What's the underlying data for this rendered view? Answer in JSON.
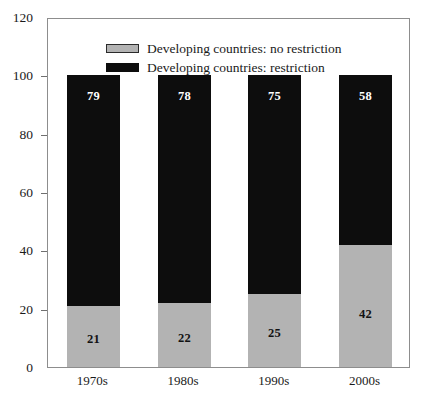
{
  "caption_sliver": " ",
  "legend": {
    "position": "top-left-inside",
    "items": [
      {
        "label": "Developing countries: no restriction",
        "swatch": "gray-swatch",
        "color": "#b3b3b3"
      },
      {
        "label": "Developing countries: restriction",
        "swatch": "black-swatch",
        "color": "#0d0d0d"
      }
    ]
  },
  "axes": {
    "y_ticks": [
      "0",
      "20",
      "40",
      "60",
      "80",
      "100",
      "120"
    ],
    "x_ticks": [
      "1970s",
      "1980s",
      "1990s",
      "2000s"
    ]
  },
  "chart_data": {
    "type": "bar",
    "title": "",
    "subtitle": "",
    "xlabel": "",
    "ylabel": "",
    "stacked": true,
    "grid": false,
    "legend_position": "upper left (inside plot area)",
    "ylim": [
      0,
      120
    ],
    "ytick_step": 20,
    "yticks": [
      0,
      20,
      40,
      60,
      80,
      100,
      120
    ],
    "categories": [
      "1970s",
      "1980s",
      "1990s",
      "2000s"
    ],
    "series": [
      {
        "name": "Developing countries: no restriction",
        "color": "#b3b3b3",
        "values": [
          21,
          22,
          25,
          42
        ],
        "labels": [
          "21",
          "22",
          "25",
          "42"
        ]
      },
      {
        "name": "Developing countries: restriction",
        "color": "#0d0d0d",
        "values": [
          79,
          78,
          75,
          58
        ],
        "labels": [
          "79",
          "78",
          "75",
          "58"
        ]
      }
    ],
    "totals": [
      100,
      100,
      100,
      100
    ],
    "annotations": []
  }
}
